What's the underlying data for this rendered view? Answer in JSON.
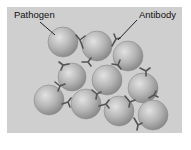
{
  "diagram": {
    "labels": {
      "pathogen": "Pathogen",
      "antibody": "Antibody"
    },
    "colors": {
      "panel_bg": "#cfcfcf",
      "sphere_light": "#d8d8d8",
      "sphere_dark": "#8a8a8a",
      "antibody": "#555555",
      "text": "#111111"
    },
    "pathogens": [
      {
        "cx": 63,
        "cy": 42,
        "r": 15
      },
      {
        "cx": 97,
        "cy": 46,
        "r": 15
      },
      {
        "cx": 128,
        "cy": 56,
        "r": 15
      },
      {
        "cx": 72,
        "cy": 77,
        "r": 14
      },
      {
        "cx": 107,
        "cy": 80,
        "r": 15
      },
      {
        "cx": 143,
        "cy": 88,
        "r": 15
      },
      {
        "cx": 49,
        "cy": 100,
        "r": 15
      },
      {
        "cx": 86,
        "cy": 104,
        "r": 15
      },
      {
        "cx": 119,
        "cy": 111,
        "r": 15
      },
      {
        "cx": 153,
        "cy": 115,
        "r": 15
      }
    ]
  }
}
